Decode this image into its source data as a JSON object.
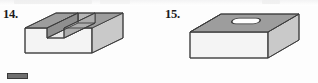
{
  "page": {
    "background_color": "#fdfdfd",
    "width": 318,
    "height": 83
  },
  "figures": [
    {
      "number_label": "14.",
      "name": "block-with-rectangular-slot",
      "description": "Rectangular block with a rectangular through-slot cut across the top face",
      "faces": {
        "top_color": "#9d9d9d",
        "front_color": "#f4f4f4",
        "right_color": "#c9c9c9",
        "slot_floor_color": "#e8e8e8",
        "slot_wall_color": "#b5b5b5",
        "outline_color": "#3c3c3c"
      }
    },
    {
      "number_label": "15.",
      "name": "block-with-oval-slot-hole",
      "description": "Rectangular block with an oval (obround) slot hole on the top face",
      "faces": {
        "top_color": "#9d9d9d",
        "front_color": "#f4f4f4",
        "right_color": "#c9c9c9",
        "hole_fill_color": "#ffffff",
        "outline_color": "#3c3c3c"
      }
    }
  ],
  "artifact": {
    "name": "scan-edge-artifact",
    "color": "#6f6f6f"
  }
}
